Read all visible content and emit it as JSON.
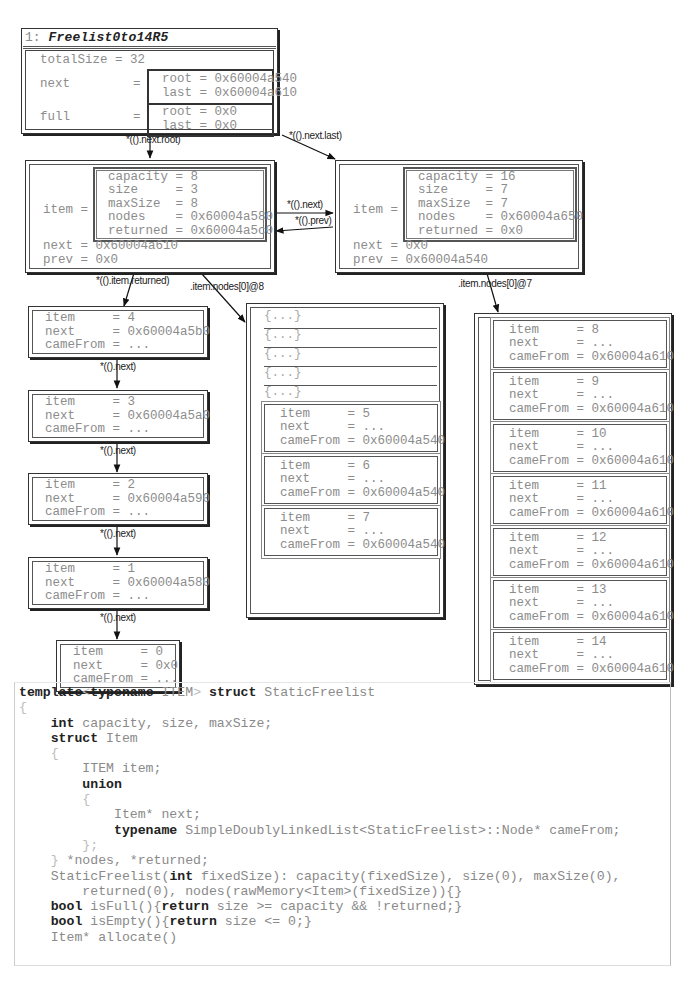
{
  "root_panel": {
    "index": "1:",
    "title": "Freelist0to14R5",
    "totalSize": "totalSize = 32",
    "next_label": "next",
    "next_eq": "=",
    "next_root": "root = 0x60004a540",
    "next_last": "last = 0x60004a610",
    "full_label": "full",
    "full_eq": "=",
    "full_root": "root = 0x0",
    "full_last": "last = 0x0"
  },
  "edges": {
    "next_root": "*(().next.root)",
    "next_last": "*(().next.last)",
    "next": "*(().next)",
    "prev": "*(().prev)",
    "item_returned": "*(().item.returned)",
    "nodes_8": ".item.nodes[0]@8",
    "nodes_7": ".item.nodes[0]@7",
    "chain_next": "*(().next)"
  },
  "freelist_a": {
    "item_label": "item =",
    "fields": [
      "capacity = 8",
      "size     = 3",
      "maxSize  = 8",
      "nodes    = 0x60004a580",
      "returned = 0x60004a5c0"
    ],
    "next": "next = 0x60004a610",
    "prev": "prev = 0x0"
  },
  "freelist_b": {
    "item_label": "item =",
    "fields": [
      "capacity = 16",
      "size     = 7",
      "maxSize  = 7",
      "nodes    = 0x60004a650",
      "returned = 0x0"
    ],
    "next": "next = 0x0",
    "prev": "prev = 0x60004a540"
  },
  "returned_chain": [
    {
      "item": "item     = 4",
      "next": "next     = 0x60004a5b0",
      "cameFrom": "cameFrom = ..."
    },
    {
      "item": "item     = 3",
      "next": "next     = 0x60004a5a0",
      "cameFrom": "cameFrom = ..."
    },
    {
      "item": "item     = 2",
      "next": "next     = 0x60004a590",
      "cameFrom": "cameFrom = ..."
    },
    {
      "item": "item     = 1",
      "next": "next     = 0x60004a580",
      "cameFrom": "cameFrom = ..."
    },
    {
      "item": "item     = 0",
      "next": "next     = 0x0",
      "cameFrom": "cameFrom = ..."
    }
  ],
  "nodes_array_a": {
    "collapsed": [
      "{...}",
      "{...}",
      "{...}",
      "{...}",
      "{...}"
    ],
    "items": [
      {
        "item": "item     = 5",
        "next": "next     = ...",
        "cameFrom": "cameFrom = 0x60004a540"
      },
      {
        "item": "item     = 6",
        "next": "next     = ...",
        "cameFrom": "cameFrom = 0x60004a540"
      },
      {
        "item": "item     = 7",
        "next": "next     = ...",
        "cameFrom": "cameFrom = 0x60004a540"
      }
    ]
  },
  "nodes_array_b": {
    "items": [
      {
        "item": "item     = 8",
        "next": "next     = ...",
        "cameFrom": "cameFrom = 0x60004a610"
      },
      {
        "item": "item     = 9",
        "next": "next     = ...",
        "cameFrom": "cameFrom = 0x60004a610"
      },
      {
        "item": "item     = 10",
        "next": "next     = ...",
        "cameFrom": "cameFrom = 0x60004a610"
      },
      {
        "item": "item     = 11",
        "next": "next     = ...",
        "cameFrom": "cameFrom = 0x60004a610"
      },
      {
        "item": "item     = 12",
        "next": "next     = ...",
        "cameFrom": "cameFrom = 0x60004a610"
      },
      {
        "item": "item     = 13",
        "next": "next     = ...",
        "cameFrom": "cameFrom = 0x60004a610"
      },
      {
        "item": "item     = 14",
        "next": "next     = ...",
        "cameFrom": "cameFrom = 0x60004a610"
      }
    ]
  },
  "code": {
    "lines": [
      [
        [
          "kw",
          "template"
        ],
        [
          "punc",
          "<"
        ],
        [
          "kw",
          "typename"
        ],
        [
          "t",
          " ITEM"
        ],
        [
          "punc",
          ">"
        ],
        [
          "t",
          " "
        ],
        [
          "kw",
          "struct"
        ],
        [
          "t",
          " StaticFreelist"
        ]
      ],
      [
        [
          "punc",
          "{"
        ]
      ],
      [
        [
          "t",
          "    "
        ],
        [
          "kw",
          "int"
        ],
        [
          "t",
          " capacity, size, maxSize;"
        ]
      ],
      [
        [
          "t",
          "    "
        ],
        [
          "kw",
          "struct"
        ],
        [
          "t",
          " Item"
        ]
      ],
      [
        [
          "t",
          "    "
        ],
        [
          "punc",
          "{"
        ]
      ],
      [
        [
          "t",
          "        ITEM item;"
        ]
      ],
      [
        [
          "t",
          "        "
        ],
        [
          "kw",
          "union"
        ]
      ],
      [
        [
          "t",
          "        "
        ],
        [
          "punc",
          "{"
        ]
      ],
      [
        [
          "t",
          "            Item* next;"
        ]
      ],
      [
        [
          "t",
          "            "
        ],
        [
          "kw",
          "typename"
        ],
        [
          "t",
          " SimpleDoublyLinkedList<StaticFreelist>::Node* cameFrom;"
        ]
      ],
      [
        [
          "t",
          "        "
        ],
        [
          "punc",
          "};"
        ]
      ],
      [
        [
          "t",
          "    "
        ],
        [
          "punc",
          "}"
        ],
        [
          "t",
          " *nodes, *returned;"
        ]
      ],
      [
        [
          "t",
          "    StaticFreelist("
        ],
        [
          "kw",
          "int"
        ],
        [
          "t",
          " fixedSize): capacity(fixedSize), size(0), maxSize(0),"
        ]
      ],
      [
        [
          "t",
          "        returned(0), nodes(rawMemory<Item>(fixedSize)){}"
        ]
      ],
      [
        [
          "t",
          "    "
        ],
        [
          "kw",
          "bool"
        ],
        [
          "t",
          " isFull(){"
        ],
        [
          "kw",
          "return"
        ],
        [
          "t",
          " size >= capacity && !returned;}"
        ]
      ],
      [
        [
          "t",
          "    "
        ],
        [
          "kw",
          "bool"
        ],
        [
          "t",
          " isEmpty(){"
        ],
        [
          "kw",
          "return"
        ],
        [
          "t",
          " size <= 0;}"
        ]
      ],
      [
        [
          "t",
          "    Item* allocate()"
        ]
      ]
    ]
  }
}
